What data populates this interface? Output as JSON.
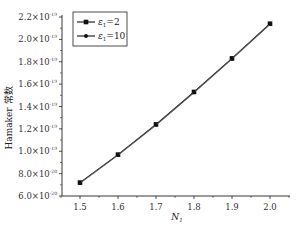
{
  "chart_data": {
    "type": "line",
    "title": "",
    "xlabel": "N",
    "xlabel_subscript": "1",
    "ylabel": "Hamaker 常数",
    "xlim": [
      1.45,
      2.05
    ],
    "ylim": [
      6e-20,
      2.2e-19
    ],
    "grid": false,
    "legend_position": "upper-left",
    "x_ticks": [
      1.5,
      1.6,
      1.7,
      1.8,
      1.9,
      2.0
    ],
    "x_tick_labels": [
      "1.5",
      "1.6",
      "1.7",
      "1.8",
      "1.9",
      "2.0"
    ],
    "y_ticks": [
      6e-20,
      8e-20,
      1e-19,
      1.2e-19,
      1.4e-19,
      1.6e-19,
      1.8e-19,
      2e-19,
      2.2e-19
    ],
    "y_tick_labels": [
      {
        "mantissa": "6.0×10",
        "exp": "-20"
      },
      {
        "mantissa": "8.0×10",
        "exp": "-20"
      },
      {
        "mantissa": "1.0×10",
        "exp": "-19"
      },
      {
        "mantissa": "1.2×10",
        "exp": "-19"
      },
      {
        "mantissa": "1.4×10",
        "exp": "-19"
      },
      {
        "mantissa": "1.6×10",
        "exp": "-19"
      },
      {
        "mantissa": "1.8×10",
        "exp": "-19"
      },
      {
        "mantissa": "2.0×10",
        "exp": "-19"
      },
      {
        "mantissa": "2.2×10",
        "exp": "-19"
      }
    ],
    "x": [
      1.5,
      1.6,
      1.7,
      1.8,
      1.9,
      2.0
    ],
    "series": [
      {
        "name": "ε1=2",
        "label_main": "ε",
        "label_sub": "1",
        "label_rest": "=2",
        "marker": "square",
        "color": "#000000",
        "values": [
          7.2e-20,
          9.7e-20,
          1.24e-19,
          1.53e-19,
          1.83e-19,
          2.14e-19
        ]
      },
      {
        "name": "ε1=10",
        "label_main": "ε",
        "label_sub": "1",
        "label_rest": "=10",
        "marker": "circle",
        "color": "#333333",
        "values": [
          7.15e-20,
          9.65e-20,
          1.235e-19,
          1.525e-19,
          1.825e-19,
          2.135e-19
        ]
      }
    ]
  }
}
